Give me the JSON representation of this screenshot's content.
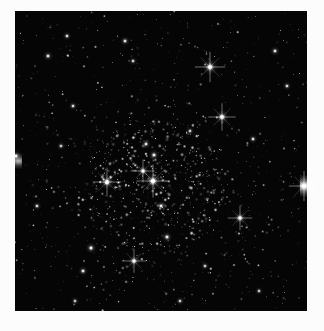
{
  "figure": {
    "image_type": "astronomical-photograph",
    "color_mode": "grayscale",
    "background_color": "#050505",
    "star_color": "#ffffff",
    "margin_color": "#fcfcfc",
    "frame": {
      "x": 15,
      "y": 11,
      "width": 292,
      "height": 300
    }
  },
  "chart_data": {
    "type": "scatter",
    "xlabel": "",
    "ylabel": "",
    "xlim": [
      0,
      292
    ],
    "ylim": [
      0,
      300
    ],
    "grid": false,
    "legend": "none",
    "background": "#050505",
    "point_color": "#ffffff",
    "note": "x,y in field pixels from top-left of dark frame; r = radius px; b = brightness 0-1",
    "bright_stars": [
      {
        "x": 195,
        "y": 56,
        "r": 4.2,
        "b": 1.0,
        "spikes": true
      },
      {
        "x": 207,
        "y": 106,
        "r": 3.8,
        "b": 0.98,
        "spikes": true
      },
      {
        "x": 138,
        "y": 170,
        "r": 4.6,
        "b": 1.0,
        "spikes": true
      },
      {
        "x": 92,
        "y": 171,
        "r": 4.0,
        "b": 0.97,
        "spikes": true
      },
      {
        "x": 128,
        "y": 160,
        "r": 3.2,
        "b": 0.92,
        "spikes": true
      },
      {
        "x": 139,
        "y": 144,
        "r": 2.9,
        "b": 0.9,
        "spikes": false
      },
      {
        "x": 131,
        "y": 133,
        "r": 2.6,
        "b": 0.85,
        "spikes": false
      },
      {
        "x": 146,
        "y": 195,
        "r": 2.8,
        "b": 0.88,
        "spikes": false
      },
      {
        "x": 225,
        "y": 207,
        "r": 3.4,
        "b": 0.95,
        "spikes": true
      },
      {
        "x": 152,
        "y": 226,
        "r": 2.9,
        "b": 0.88,
        "spikes": false
      },
      {
        "x": 119,
        "y": 250,
        "r": 3.3,
        "b": 0.93,
        "spikes": true
      },
      {
        "x": 76,
        "y": 237,
        "r": 3.0,
        "b": 0.9,
        "spikes": false
      },
      {
        "x": 68,
        "y": 260,
        "r": 2.7,
        "b": 0.86,
        "spikes": false
      },
      {
        "x": 289,
        "y": 175,
        "r": 4.2,
        "b": 1.0,
        "spikes": true
      },
      {
        "x": 1,
        "y": 145,
        "r": 3.0,
        "b": 0.9,
        "spikes": false
      },
      {
        "x": 33,
        "y": 45,
        "r": 2.7,
        "b": 0.85,
        "spikes": false
      },
      {
        "x": 52,
        "y": 25,
        "r": 2.4,
        "b": 0.8,
        "spikes": false
      },
      {
        "x": 110,
        "y": 30,
        "r": 2.6,
        "b": 0.84,
        "spikes": false
      },
      {
        "x": 118,
        "y": 50,
        "r": 2.3,
        "b": 0.78,
        "spikes": false
      },
      {
        "x": 260,
        "y": 40,
        "r": 2.6,
        "b": 0.84,
        "spikes": false
      },
      {
        "x": 272,
        "y": 75,
        "r": 2.4,
        "b": 0.8,
        "spikes": false
      },
      {
        "x": 238,
        "y": 128,
        "r": 2.5,
        "b": 0.82,
        "spikes": false
      },
      {
        "x": 175,
        "y": 120,
        "r": 2.3,
        "b": 0.8,
        "spikes": false
      },
      {
        "x": 58,
        "y": 95,
        "r": 2.4,
        "b": 0.8,
        "spikes": false
      },
      {
        "x": 46,
        "y": 135,
        "r": 2.3,
        "b": 0.78,
        "spikes": false
      },
      {
        "x": 22,
        "y": 195,
        "r": 2.4,
        "b": 0.8,
        "spikes": false
      },
      {
        "x": 190,
        "y": 255,
        "r": 2.3,
        "b": 0.78,
        "spikes": false
      },
      {
        "x": 244,
        "y": 280,
        "r": 2.2,
        "b": 0.76,
        "spikes": false
      },
      {
        "x": 165,
        "y": 290,
        "r": 2.3,
        "b": 0.78,
        "spikes": false
      },
      {
        "x": 60,
        "y": 290,
        "r": 2.2,
        "b": 0.76,
        "spikes": false
      }
    ],
    "cluster_core": {
      "cx": 140,
      "cy": 175,
      "radius": 70,
      "density": 0.55
    },
    "field_star_count": 2400,
    "seed": 20240517
  }
}
